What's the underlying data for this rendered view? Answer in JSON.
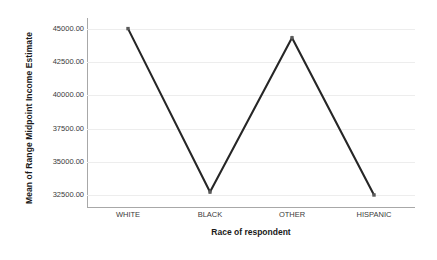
{
  "chart_data": {
    "type": "line",
    "title": "",
    "xlabel": "Race of respondent",
    "ylabel": "Mean of Range Midpoint Income Estimate",
    "categories": [
      "WHITE",
      "BLACK",
      "OTHER",
      "HISPANIC"
    ],
    "values": [
      45000.0,
      32730.0,
      44310.0,
      32500.0
    ],
    "series": [
      {
        "name": "Mean of Range Midpoint Income Estimate",
        "values": [
          45000.0,
          32730.0,
          44310.0,
          32500.0
        ]
      }
    ],
    "ylim": [
      31600,
      45800
    ],
    "ytick_values": [
      45000,
      42500,
      40000,
      37500,
      35000,
      32500
    ],
    "ytick_labels": [
      "45000.00",
      "42500.00",
      "40000.00",
      "37500.00",
      "35000.00",
      "32500.00"
    ],
    "grid": true,
    "grid_axis": "y",
    "legend": false,
    "legend_position": "none",
    "line_color": "#262626",
    "marker": "square",
    "marker_color": "#5a5a5a",
    "grid_color": "#ededed",
    "axis_color": "#a8a8a8",
    "background_color": "#ffffff"
  }
}
